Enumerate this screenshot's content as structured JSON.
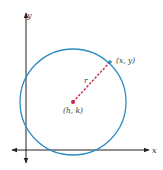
{
  "diagram": {
    "axes": {
      "x_label": "x",
      "y_label": "y"
    },
    "circle": {
      "center_label": "(h, k)",
      "point_label": "(x, y)",
      "radius_label": "r"
    },
    "colors": {
      "circle": "#2b8cc4",
      "radius_line": "#c8244a",
      "center_point": "#c8244a",
      "edge_point": "#2b8cc4",
      "axes": "#222222"
    }
  }
}
